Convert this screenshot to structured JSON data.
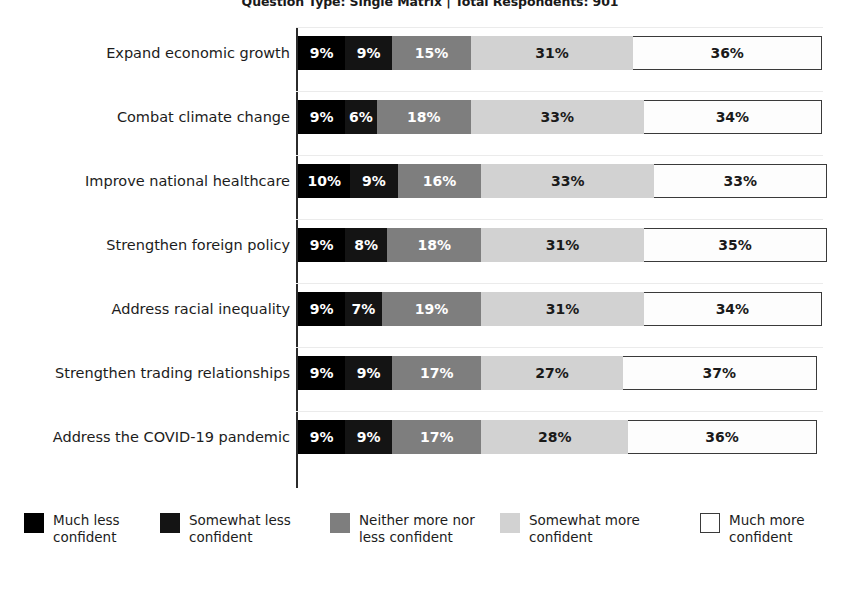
{
  "chart_data": {
    "type": "bar",
    "subtype": "stacked-horizontal-100-percent",
    "title": "Question Type: Single Matrix | Total Respondents: 901",
    "xlabel": "",
    "ylabel": "",
    "xlim": [
      0,
      100
    ],
    "grid": true,
    "legend_position": "bottom",
    "value_suffix": "%",
    "categories": [
      "Expand economic growth",
      "Combat climate change",
      "Improve national healthcare",
      "Strengthen foreign policy",
      "Address racial inequality",
      "Strengthen trading relationships",
      "Address the COVID-19 pandemic"
    ],
    "series": [
      {
        "name": "Much less confident",
        "color": "#000000",
        "values": [
          9,
          9,
          10,
          9,
          9,
          9,
          9
        ],
        "labels": [
          "9%",
          "9%",
          "10%",
          "9%",
          "9%",
          "9%",
          "9%"
        ]
      },
      {
        "name": "Somewhat less confident",
        "color": "#141414",
        "values": [
          9,
          6,
          9,
          8,
          7,
          9,
          9
        ],
        "labels": [
          "9%",
          "6%",
          "9%",
          "8%",
          "7%",
          "9%",
          "9%"
        ]
      },
      {
        "name": "Neither more nor less confident",
        "color": "#7e7e7e",
        "values": [
          15,
          18,
          16,
          18,
          19,
          17,
          17
        ],
        "labels": [
          "15%",
          "18%",
          "16%",
          "18%",
          "19%",
          "17%",
          "17%"
        ]
      },
      {
        "name": "Somewhat more confident",
        "color": "#d2d2d2",
        "values": [
          31,
          33,
          33,
          31,
          31,
          27,
          28
        ],
        "labels": [
          "31%",
          "33%",
          "33%",
          "31%",
          "31%",
          "27%",
          "28%"
        ]
      },
      {
        "name": "Much more confident",
        "color": "#ffffff",
        "values": [
          36,
          34,
          33,
          35,
          34,
          37,
          36
        ],
        "labels": [
          "36%",
          "34%",
          "33%",
          "35%",
          "34%",
          "37%",
          "36%"
        ]
      }
    ]
  },
  "legend": {
    "items": [
      {
        "label": "Much less\nconfident",
        "swatch_class": "sw0"
      },
      {
        "label": "Somewhat less\nconfident",
        "swatch_class": "sw1"
      },
      {
        "label": "Neither more nor\nless confident",
        "swatch_class": "sw2"
      },
      {
        "label": "Somewhat more\nconfident",
        "swatch_class": "sw3"
      },
      {
        "label": "Much more\nconfident",
        "swatch_class": "sw4"
      }
    ]
  }
}
